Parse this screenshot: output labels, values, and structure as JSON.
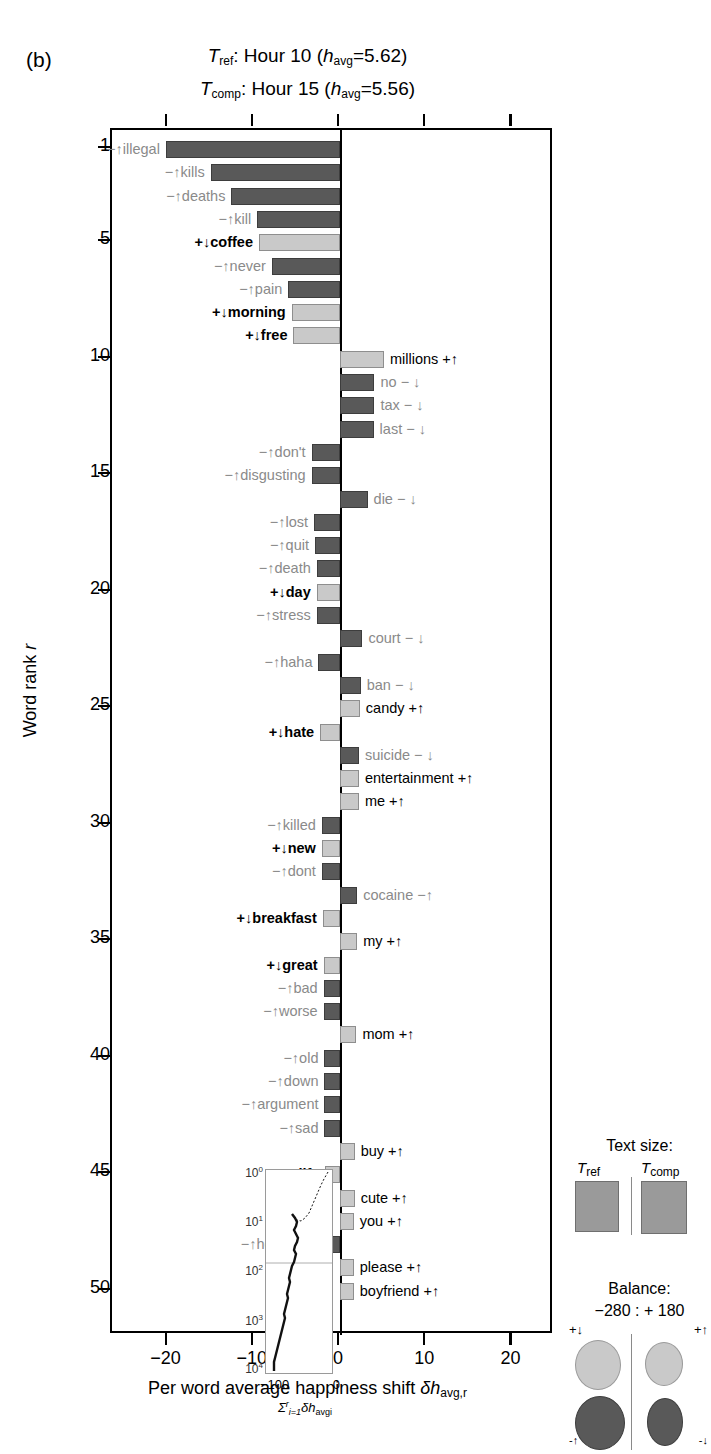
{
  "panel": {
    "label": "(b)"
  },
  "title": {
    "line1": {
      "sym": "T",
      "sub": "ref",
      "text": ": Hour 10 (",
      "hsym": "h",
      "hsub": "avg",
      "val": "=5.62)"
    },
    "line2": {
      "sym": "T",
      "sub": "comp",
      "text": ": Hour 15 (",
      "hsym": "h",
      "hsub": "avg",
      "val": "=5.56)"
    }
  },
  "axes": {
    "ylabel_pre": "Word rank ",
    "ylabel_sym": "r",
    "xlabel": "Per word average happiness shift ",
    "xlabel_sym": "δh",
    "xlabel_sub": "avg,r",
    "yticks": [
      1,
      5,
      10,
      15,
      20,
      25,
      30,
      35,
      40,
      45,
      50
    ],
    "xticks": [
      "−20",
      "−10",
      "0",
      "10",
      "20"
    ]
  },
  "inset": {
    "yticks": [
      "10",
      "10",
      "10",
      "10",
      "10"
    ],
    "yexps": [
      "0",
      "1",
      "2",
      "3",
      "4"
    ],
    "xmin": "−100",
    "xmax": "0",
    "title_sigma": "Σ",
    "title_sup": "r",
    "title_sub": "i=1",
    "title_rest": "δh",
    "title_rest_sub": "avgi"
  },
  "legend_text": {
    "heading": "Text size:",
    "ref_label_sym": "T",
    "ref_label_sub": "ref",
    "comp_label_sym": "T",
    "comp_label_sub": "comp"
  },
  "legend_balance": {
    "heading": "Balance:",
    "values": "−280 : + 180",
    "top_left": "+↓",
    "top_right": "+↑",
    "bottom_left": "-↑",
    "bottom_right": "-↓"
  },
  "chart_data": {
    "type": "bar",
    "xlabel": "Per word average happiness shift",
    "ylabel": "Word rank r",
    "xlim": [
      -25,
      25
    ],
    "ylim": [
      0.5,
      51
    ],
    "grid": false,
    "orientation": "horizontal",
    "bars": [
      {
        "rank": 1,
        "word": "illegal",
        "marker": "−↑",
        "value": -20.2,
        "tone": "neg",
        "bold": false
      },
      {
        "rank": 2,
        "word": "kills",
        "marker": "−↑",
        "value": -15.0,
        "tone": "neg",
        "bold": false
      },
      {
        "rank": 3,
        "word": "deaths",
        "marker": "−↑",
        "value": -12.6,
        "tone": "neg",
        "bold": false
      },
      {
        "rank": 4,
        "word": "kill",
        "marker": "−↑",
        "value": -9.6,
        "tone": "neg",
        "bold": false
      },
      {
        "rank": 5,
        "word": "coffee",
        "marker": "+↓",
        "value": -9.4,
        "tone": "pos",
        "bold": true
      },
      {
        "rank": 6,
        "word": "never",
        "marker": "−↑",
        "value": -7.9,
        "tone": "neg",
        "bold": false
      },
      {
        "rank": 7,
        "word": "pain",
        "marker": "−↑",
        "value": -6.0,
        "tone": "neg",
        "bold": false
      },
      {
        "rank": 8,
        "word": "morning",
        "marker": "+↓",
        "value": -5.6,
        "tone": "pos",
        "bold": true
      },
      {
        "rank": 9,
        "word": "free",
        "marker": "+↓",
        "value": -5.4,
        "tone": "pos",
        "bold": true
      },
      {
        "rank": 10,
        "word": "millions",
        "marker": "+↑",
        "value": 5.1,
        "tone": "pos",
        "bold": false,
        "side": "right"
      },
      {
        "rank": 11,
        "word": "no",
        "marker": "− ↓",
        "value": 4.0,
        "tone": "neg",
        "bold": false,
        "side": "right"
      },
      {
        "rank": 12,
        "word": "tax",
        "marker": "− ↓",
        "value": 4.0,
        "tone": "neg",
        "bold": false,
        "side": "right"
      },
      {
        "rank": 13,
        "word": "last",
        "marker": "− ↓",
        "value": 3.9,
        "tone": "neg",
        "bold": false,
        "side": "right"
      },
      {
        "rank": 14,
        "word": "don't",
        "marker": "−↑",
        "value": -3.3,
        "tone": "neg",
        "bold": false
      },
      {
        "rank": 15,
        "word": "disgusting",
        "marker": "−↑",
        "value": -3.3,
        "tone": "neg",
        "bold": false
      },
      {
        "rank": 16,
        "word": "die",
        "marker": "− ↓",
        "value": 3.2,
        "tone": "neg",
        "bold": false,
        "side": "right"
      },
      {
        "rank": 17,
        "word": "lost",
        "marker": "−↑",
        "value": -3.0,
        "tone": "neg",
        "bold": false
      },
      {
        "rank": 18,
        "word": "quit",
        "marker": "−↑",
        "value": -2.9,
        "tone": "neg",
        "bold": false
      },
      {
        "rank": 19,
        "word": "death",
        "marker": "−↑",
        "value": -2.7,
        "tone": "neg",
        "bold": false
      },
      {
        "rank": 20,
        "word": "day",
        "marker": "+↓",
        "value": -2.7,
        "tone": "pos",
        "bold": true
      },
      {
        "rank": 21,
        "word": "stress",
        "marker": "−↑",
        "value": -2.7,
        "tone": "neg",
        "bold": false
      },
      {
        "rank": 22,
        "word": "court",
        "marker": "− ↓",
        "value": 2.6,
        "tone": "neg",
        "bold": false,
        "side": "right"
      },
      {
        "rank": 23,
        "word": "haha",
        "marker": "−↑",
        "value": -2.5,
        "tone": "neg",
        "bold": false
      },
      {
        "rank": 24,
        "word": "ban",
        "marker": "− ↓",
        "value": 2.4,
        "tone": "neg",
        "bold": false,
        "side": "right"
      },
      {
        "rank": 25,
        "word": "candy",
        "marker": "+↑",
        "value": 2.3,
        "tone": "pos",
        "bold": false,
        "side": "right"
      },
      {
        "rank": 26,
        "word": "hate",
        "marker": "+↓",
        "value": -2.3,
        "tone": "pos",
        "bold": true
      },
      {
        "rank": 27,
        "word": "suicide",
        "marker": "− ↓",
        "value": 2.2,
        "tone": "neg",
        "bold": false,
        "side": "right"
      },
      {
        "rank": 28,
        "word": "entertainment",
        "marker": "+↑",
        "value": 2.2,
        "tone": "pos",
        "bold": false,
        "side": "right"
      },
      {
        "rank": 29,
        "word": "me",
        "marker": "+↑",
        "value": 2.2,
        "tone": "pos",
        "bold": false,
        "side": "right"
      },
      {
        "rank": 30,
        "word": "killed",
        "marker": "−↑",
        "value": -2.1,
        "tone": "neg",
        "bold": false
      },
      {
        "rank": 31,
        "word": "new",
        "marker": "+↓",
        "value": -2.1,
        "tone": "pos",
        "bold": true
      },
      {
        "rank": 32,
        "word": "dont",
        "marker": "−↑",
        "value": -2.1,
        "tone": "neg",
        "bold": false
      },
      {
        "rank": 33,
        "word": "cocaine",
        "marker": "−↑",
        "value": 2.0,
        "tone": "neg",
        "bold": false,
        "side": "right"
      },
      {
        "rank": 34,
        "word": "breakfast",
        "marker": "+↓",
        "value": -2.0,
        "tone": "pos",
        "bold": true
      },
      {
        "rank": 35,
        "word": "my",
        "marker": "+↑",
        "value": 2.0,
        "tone": "pos",
        "bold": false,
        "side": "right"
      },
      {
        "rank": 36,
        "word": "great",
        "marker": "+↓",
        "value": -1.9,
        "tone": "pos",
        "bold": true,
        "wordbold": true
      },
      {
        "rank": 37,
        "word": "bad",
        "marker": "−↑",
        "value": -1.9,
        "tone": "neg",
        "bold": false
      },
      {
        "rank": 38,
        "word": "worse",
        "marker": "−↑",
        "value": -1.9,
        "tone": "neg",
        "bold": false
      },
      {
        "rank": 39,
        "word": "mom",
        "marker": "+↑",
        "value": 1.9,
        "tone": "pos",
        "bold": false,
        "side": "right"
      },
      {
        "rank": 40,
        "word": "old",
        "marker": "−↑",
        "value": -1.8,
        "tone": "neg",
        "bold": false
      },
      {
        "rank": 41,
        "word": "down",
        "marker": "−↑",
        "value": -1.8,
        "tone": "neg",
        "bold": false
      },
      {
        "rank": 42,
        "word": "argument",
        "marker": "−↑",
        "value": -1.8,
        "tone": "neg",
        "bold": false
      },
      {
        "rank": 43,
        "word": "sad",
        "marker": "−↑",
        "value": -1.8,
        "tone": "neg",
        "bold": false
      },
      {
        "rank": 44,
        "word": "buy",
        "marker": "+↑",
        "value": 1.7,
        "tone": "pos",
        "bold": false,
        "side": "right"
      },
      {
        "rank": 45,
        "word": "life",
        "marker": "+↓",
        "value": -1.7,
        "tone": "pos",
        "bold": true
      },
      {
        "rank": 46,
        "word": "cute",
        "marker": "+↑",
        "value": 1.7,
        "tone": "pos",
        "bold": false,
        "side": "right"
      },
      {
        "rank": 47,
        "word": "you",
        "marker": "+↑",
        "value": 1.6,
        "tone": "pos",
        "bold": false,
        "side": "right"
      },
      {
        "rank": 48,
        "word": "headache",
        "marker": "−↑",
        "value": -1.6,
        "tone": "neg",
        "bold": false
      },
      {
        "rank": 49,
        "word": "please",
        "marker": "+↑",
        "value": 1.6,
        "tone": "pos",
        "bold": false,
        "side": "right"
      },
      {
        "rank": 50,
        "word": "boyfriend",
        "marker": "+↑",
        "value": 1.6,
        "tone": "pos",
        "bold": false,
        "side": "right"
      }
    ],
    "inset_series": {
      "name": "cumulative happiness shift",
      "xlabel": "sum of dh_avg,i",
      "ylabel": "word rank (log)",
      "xlim": [
        -120,
        5
      ],
      "ylim_log": [
        1,
        10000
      ]
    }
  }
}
